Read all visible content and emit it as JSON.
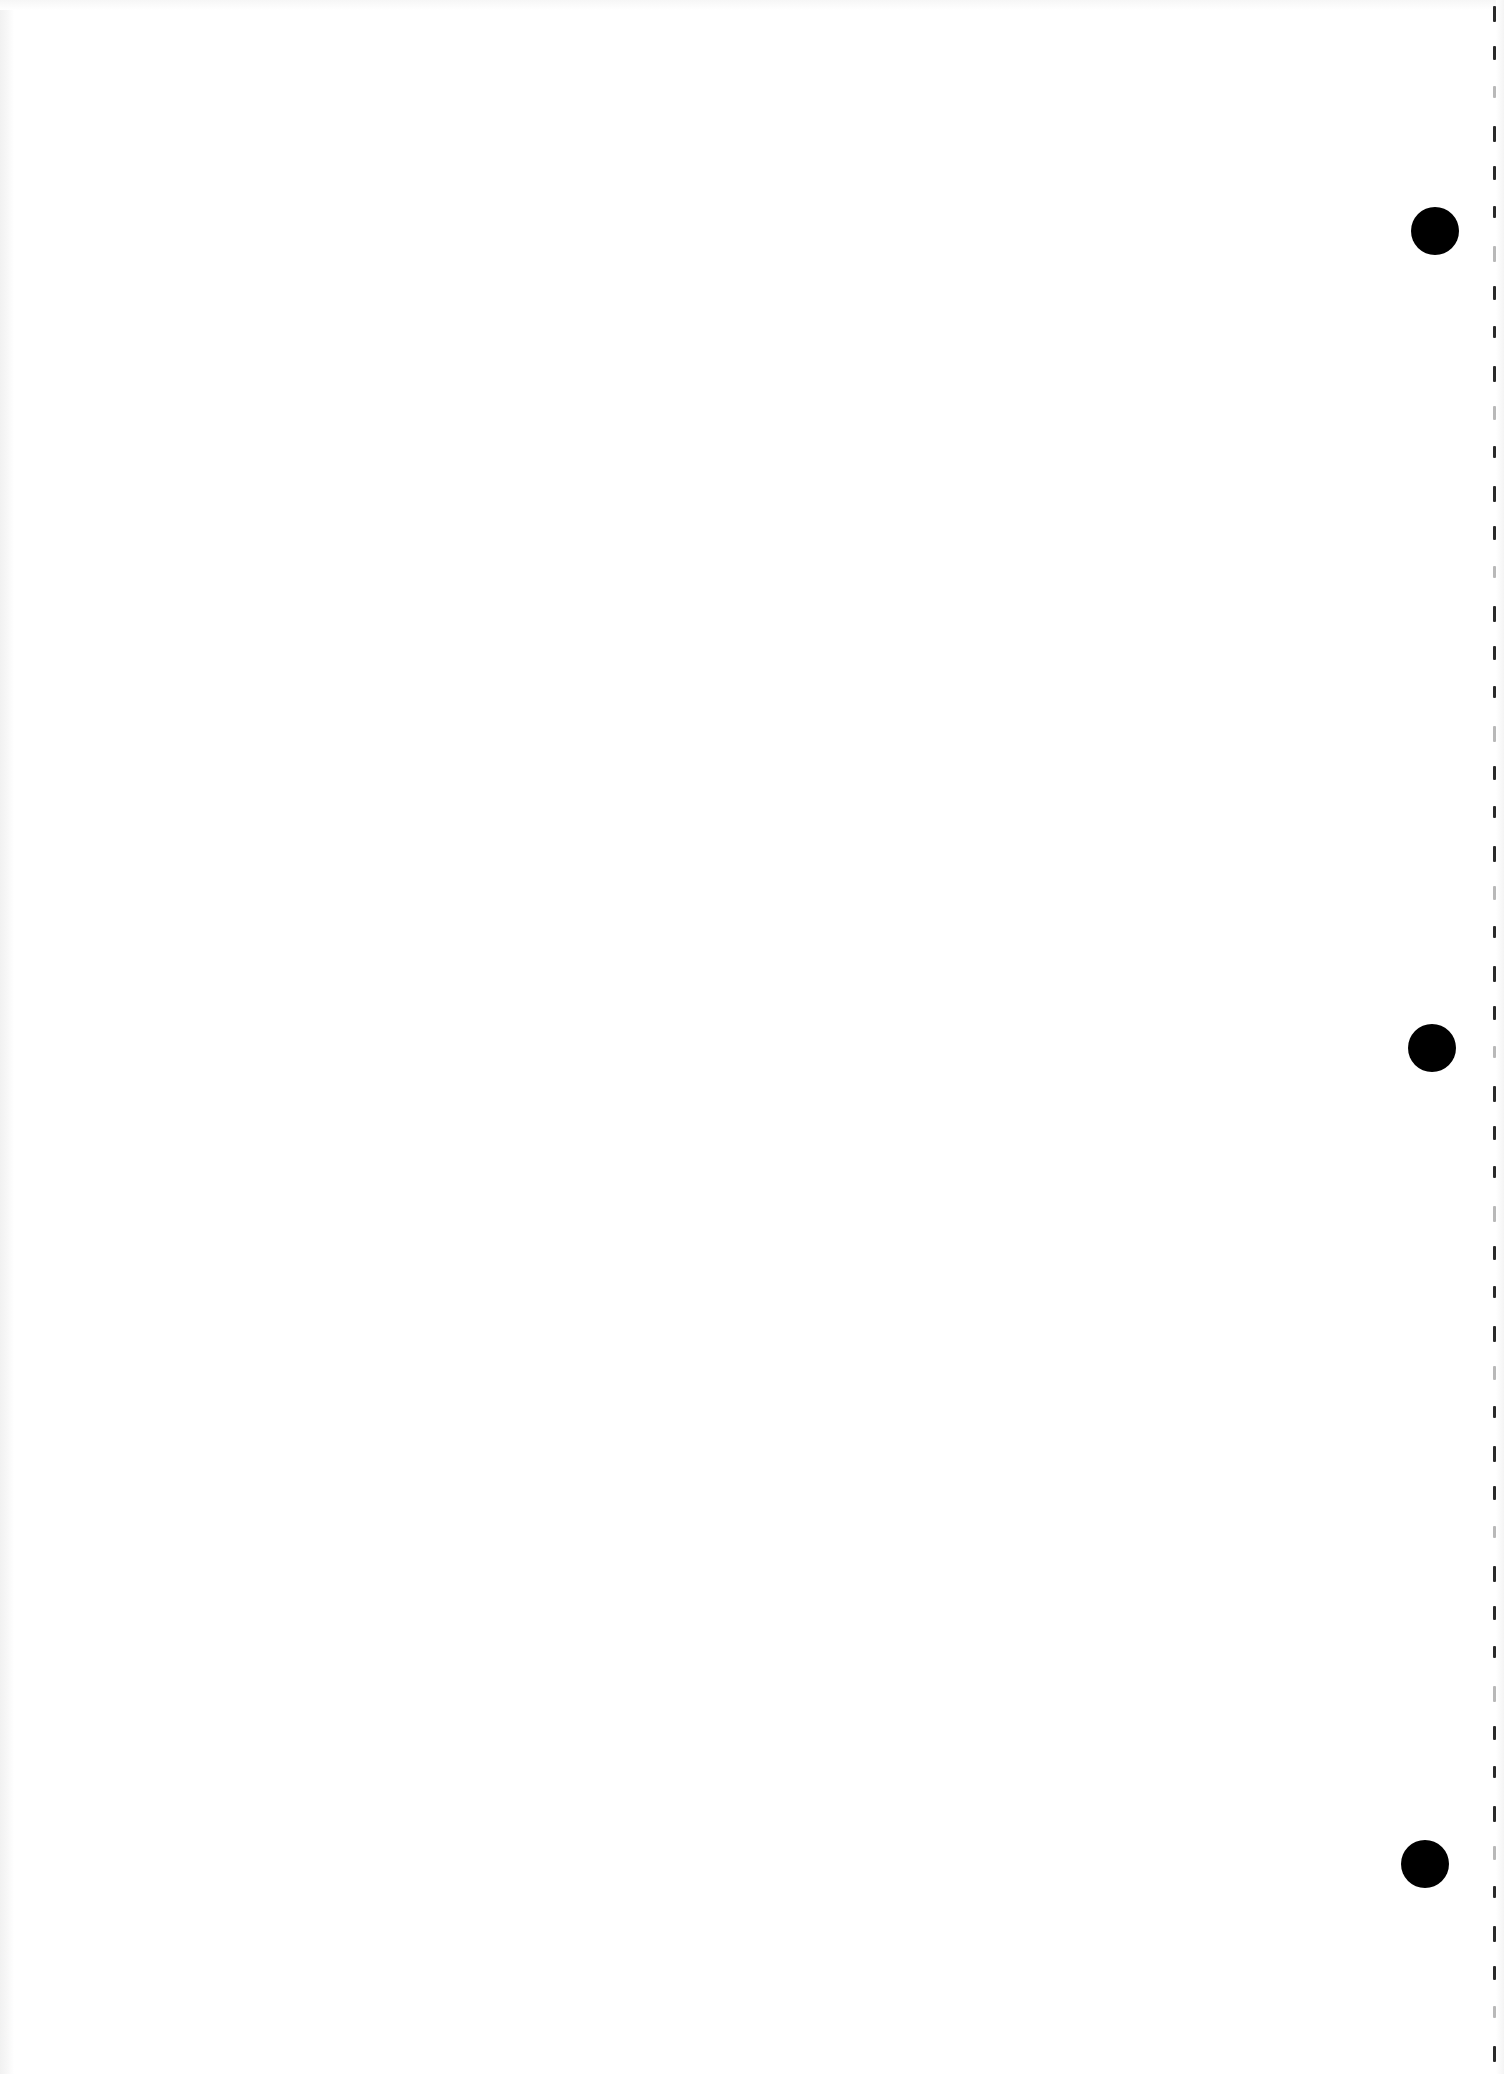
{
  "page": {
    "type": "blank-loose-leaf-sheet",
    "width": 1504,
    "height": 2074,
    "background_color": "#ffffff",
    "text_content": []
  },
  "punch_holes": [
    {
      "name": "punch-hole-top",
      "cx": 1435,
      "cy": 231,
      "r": 24
    },
    {
      "name": "punch-hole-middle",
      "cx": 1432,
      "cy": 1048,
      "r": 24
    },
    {
      "name": "punch-hole-bottom",
      "cx": 1425,
      "cy": 1864,
      "r": 24
    }
  ],
  "perforation": {
    "x": 1494,
    "spacing": 40,
    "dash_length": 16,
    "start_y": 6,
    "color": "#2a2a2a",
    "light_color": "#b8b8b8"
  },
  "colors": {
    "paper": "#ffffff",
    "hole": "#000000",
    "edge_shade": "#f1f1f1"
  }
}
